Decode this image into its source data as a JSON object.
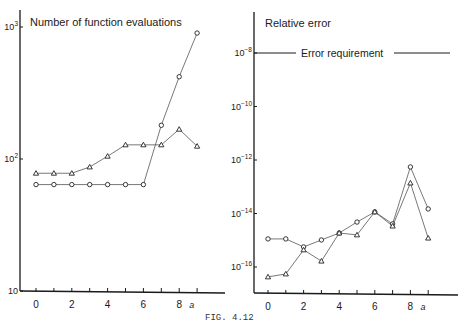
{
  "caption": "FIG. 4.12",
  "chart_data": [
    {
      "type": "line",
      "title": "Number of function evaluations",
      "xlabel": "a",
      "ylabel": "",
      "yscale": "log",
      "ylim": [
        10,
        1000
      ],
      "y_ticks": [
        {
          "value": 10,
          "label": "10"
        },
        {
          "value": 100,
          "label": "10^2"
        },
        {
          "value": 1000,
          "label": "10^3"
        }
      ],
      "x": [
        0,
        1,
        2,
        3,
        4,
        5,
        6,
        7,
        8,
        9
      ],
      "x_tick_labels": [
        "0",
        "2",
        "4",
        "6",
        "8"
      ],
      "grid": false,
      "series": [
        {
          "name": "circles",
          "marker": "circle",
          "values": [
            64,
            64,
            64,
            64,
            64,
            64,
            64,
            180,
            420,
            900
          ]
        },
        {
          "name": "triangles",
          "marker": "triangle",
          "values": [
            78,
            78,
            78,
            87,
            105,
            128,
            128,
            128,
            168,
            125
          ]
        }
      ]
    },
    {
      "type": "line",
      "title": "Relative error",
      "xlabel": "a",
      "ylabel": "",
      "yscale": "log",
      "ylim_exponent": [
        -17,
        -8
      ],
      "y_ticks": [
        {
          "exp": -8,
          "label": "10^-8"
        },
        {
          "exp": -10,
          "label": "10^-10"
        },
        {
          "exp": -12,
          "label": "10^-12"
        },
        {
          "exp": -14,
          "label": "10^-14"
        },
        {
          "exp": -16,
          "label": "10^-16"
        }
      ],
      "x": [
        0,
        1,
        2,
        3,
        4,
        5,
        6,
        7,
        8,
        9
      ],
      "x_tick_labels": [
        "0",
        "2",
        "4",
        "6",
        "8"
      ],
      "grid": false,
      "annotations": [
        {
          "text": "Error requirement",
          "y_exp": -8,
          "style": "horizontal-line"
        }
      ],
      "series": [
        {
          "name": "circles",
          "marker": "circle",
          "log10_values": [
            -14.95,
            -14.95,
            -15.25,
            -14.99,
            -14.73,
            -14.32,
            -13.94,
            -14.39,
            -12.26,
            -13.83
          ]
        },
        {
          "name": "triangles",
          "marker": "triangle",
          "log10_values": [
            -16.37,
            -16.26,
            -15.36,
            -15.78,
            -14.73,
            -14.8,
            -13.94,
            -14.47,
            -12.86,
            -14.92
          ]
        }
      ]
    }
  ]
}
